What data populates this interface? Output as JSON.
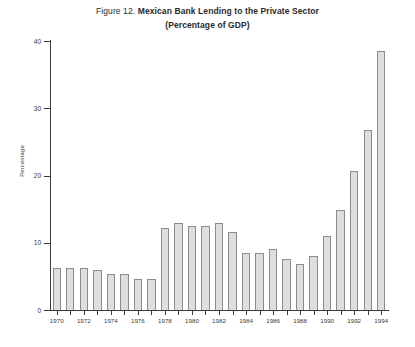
{
  "title": {
    "figure_number": "Figure 12.",
    "main": "Mexican Bank Lending to the Private Sector",
    "subtitle": "(Percentage of GDP)"
  },
  "colors": {
    "bar_fill": "#dedede",
    "bar_edge": "#8c8c8c",
    "axis": "#3b3b3b",
    "text": "#2a2a2a",
    "background": "#ffffff"
  },
  "chart_data": {
    "type": "bar",
    "title": "Figure 12. Mexican Bank Lending to the Private Sector (Percentage of GDP)",
    "xlabel": "",
    "ylabel": "Percentage",
    "ylim": [
      0,
      40
    ],
    "yticks": [
      0,
      10,
      20,
      30,
      40
    ],
    "ytick_labels": [
      "0",
      "10",
      "20",
      "30",
      "40"
    ],
    "xtick_labels": [
      "1970",
      "1972",
      "1974",
      "1976",
      "1978",
      "1980",
      "1982",
      "1984",
      "1986",
      "1988",
      "1990",
      "1992",
      "1994"
    ],
    "grid": false,
    "legend": null,
    "categories": [
      "1970",
      "1971",
      "1972",
      "1973",
      "1974",
      "1975",
      "1976",
      "1977",
      "1978",
      "1979",
      "1980",
      "1981",
      "1982",
      "1983",
      "1984",
      "1985",
      "1986",
      "1987",
      "1988",
      "1989",
      "1990",
      "1991",
      "1992",
      "1993",
      "1994"
    ],
    "values": [
      6.3,
      6.3,
      6.2,
      5.9,
      5.3,
      5.3,
      4.6,
      4.6,
      12.2,
      13.0,
      12.5,
      12.5,
      13.0,
      11.6,
      8.5,
      8.5,
      9.0,
      7.6,
      6.8,
      8.0,
      11.0,
      14.8,
      20.7,
      26.8,
      33.0
    ],
    "value_1994_extra": 38.5
  },
  "axis": {
    "y_title": "Percentage"
  }
}
